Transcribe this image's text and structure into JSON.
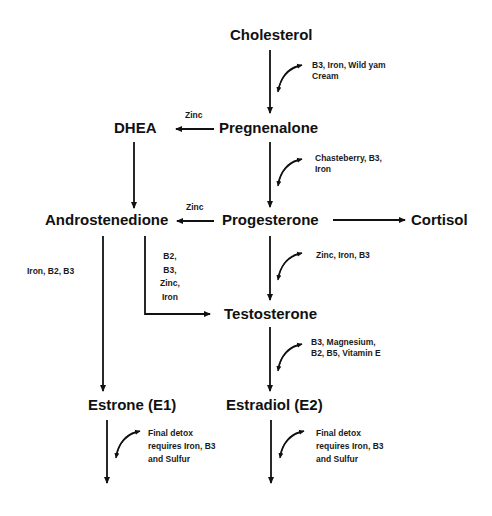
{
  "nodes": {
    "cholesterol": "Cholesterol",
    "pregnenalone": "Pregnenalone",
    "dhea": "DHEA",
    "progesterone": "Progesterone",
    "androstenedione": "Androstenedione",
    "cortisol": "Cortisol",
    "testosterone": "Testosterone",
    "estrone": "Estrone (E1)",
    "estradiol": "Estradiol (E2)"
  },
  "cofactors": {
    "cholesterol_to_pregnenalone": [
      "B3, Iron, Wild yam",
      "Cream"
    ],
    "pregnenalone_to_dhea": "Zinc",
    "pregnenalone_to_progesterone": [
      "Chasteberry, B3,",
      "Iron"
    ],
    "progesterone_to_androstenedione": "Zinc",
    "androstenedione_to_estrone": "Iron, B2, B3",
    "androstenedione_to_testosterone": [
      "B2,",
      "B3,",
      "Zinc,",
      "Iron"
    ],
    "progesterone_to_testosterone": "Zinc, Iron, B3",
    "testosterone_to_estradiol": [
      "B3, Magnesium,",
      "B2, B5, Vitamin E"
    ],
    "estrone_detox": [
      "Final detox",
      "requires Iron, B3",
      "and Sulfur"
    ],
    "estradiol_detox": [
      "Final detox",
      "requires Iron, B3",
      "and Sulfur"
    ]
  },
  "colors": {
    "line": "#111111",
    "text": "#111111",
    "background": "#ffffff"
  }
}
